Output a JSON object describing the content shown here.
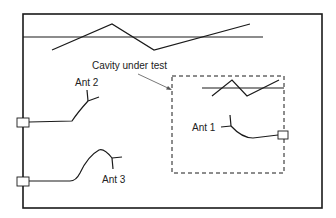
{
  "diagram": {
    "labels": {
      "cavity": "Cavity under test",
      "ant1": "Ant 1",
      "ant2": "Ant 2",
      "ant3": "Ant 3"
    },
    "colors": {
      "stroke": "#1a1a1a",
      "background": "#ffffff"
    }
  }
}
